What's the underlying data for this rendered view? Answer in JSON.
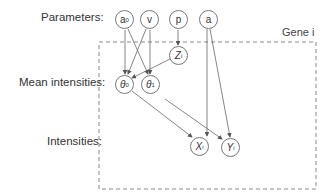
{
  "diagram": {
    "row_labels": {
      "parameters": "Parameters:",
      "mean_intensities": "Mean intensities:",
      "intensities": "Intensities:"
    },
    "plate_label": "Gene i",
    "nodes": {
      "a0": {
        "base": "a",
        "sub": "0"
      },
      "v": {
        "base": "v",
        "sub": ""
      },
      "p": {
        "base": "p",
        "sub": ""
      },
      "a": {
        "base": "a",
        "sub": ""
      },
      "Zi": {
        "base": "Z",
        "sub": "i"
      },
      "theta0": {
        "base": "θ",
        "sub": "0"
      },
      "theta1": {
        "base": "θ",
        "sub": "1"
      },
      "Xi": {
        "base": "X",
        "sub": "i"
      },
      "Yi": {
        "base": "Y",
        "sub": "i"
      }
    },
    "edges": [
      [
        "a0",
        "theta0"
      ],
      [
        "a0",
        "theta1"
      ],
      [
        "v",
        "theta0"
      ],
      [
        "v",
        "theta1"
      ],
      [
        "p",
        "Zi"
      ],
      [
        "Zi",
        "theta0"
      ],
      [
        "theta0",
        "Xi"
      ],
      [
        "theta1",
        "Yi"
      ],
      [
        "a",
        "Xi"
      ],
      [
        "a",
        "Yi"
      ]
    ]
  }
}
